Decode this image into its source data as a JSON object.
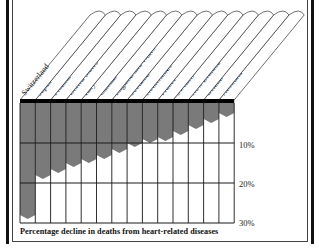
{
  "chart_data": {
    "type": "bar",
    "orientation": "vertical-downward",
    "title": "",
    "caption": "Percentage decline in deaths from heart-related diseases",
    "xlabel": "",
    "ylabel": "Percentage decline",
    "ylim": [
      0,
      30
    ],
    "yticks": [
      "10%",
      "20%",
      "30%"
    ],
    "grid": true,
    "legend": null,
    "categories": [
      "Switzerland",
      "Japan",
      "Finland",
      "United States",
      "Italy",
      "Canada",
      "England and Wales",
      "Scotland",
      "Netherlands",
      "France",
      "Sweden",
      "New Zealand",
      "Ireland",
      "Australia"
    ],
    "values": [
      29,
      19,
      17.5,
      16,
      15,
      14,
      12.5,
      11,
      10,
      9.5,
      8,
      6.5,
      5,
      3.5
    ],
    "bar_color": "#7a7a7a"
  },
  "colors": {
    "bar": "#7a7a7a",
    "grid": "#1a1a1a",
    "frame": "#111111",
    "background": "#ffffff"
  }
}
